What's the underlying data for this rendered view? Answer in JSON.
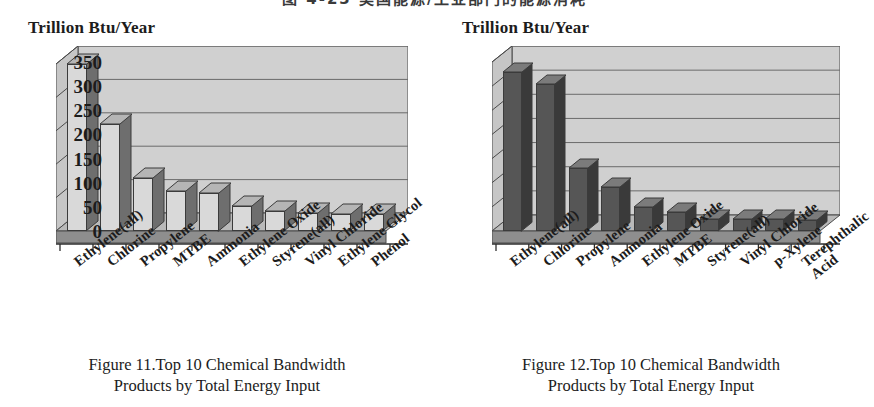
{
  "top_headline_clipped": "图 4-23  美国能源/工业部门的能源消耗",
  "figures": [
    {
      "id": "figure-11",
      "y_axis_title": "Trillion Btu/Year",
      "caption_line1": "Figure 11.Top 10 Chemical Bandwidth",
      "caption_line2": "Products by Total Energy Input",
      "bar_fill": "#d9d9d9",
      "bar_side": "#6e6e6e",
      "bar_top": "#b5b5b5"
    },
    {
      "id": "figure-12",
      "y_axis_title": "Trillion Btu/Year",
      "caption_line1": "Figure 12.Top 10 Chemical Bandwidth",
      "caption_line2": "Products by Total Energy Input",
      "bar_fill": "#565656",
      "bar_side": "#3a3a3a",
      "bar_top": "#7b7b7b"
    }
  ],
  "chart_data": [
    {
      "type": "bar",
      "id": "figure-11",
      "title": "Figure 11.Top 10 Chemical Bandwidth Products by Total Energy Input",
      "xlabel": "",
      "ylabel": "Trillion Btu/Year",
      "ylim": [
        0,
        500
      ],
      "yticks": [
        0,
        100,
        200,
        300,
        400,
        500
      ],
      "grid": true,
      "legend": "none",
      "categories": [
        "Ethylene(all)",
        "Chlorine",
        "Propylene",
        "MTBE",
        "Ammonia",
        "Ethylene Oxide",
        "Styrene(all)",
        "Vinyl Chloride",
        "Ethylene Glycol",
        "Phenol"
      ],
      "values": [
        500,
        320,
        160,
        120,
        115,
        75,
        60,
        55,
        50,
        50
      ]
    },
    {
      "type": "bar",
      "id": "figure-12",
      "title": "Figure 12.Top 10 Chemical Bandwidth Products by Total Energy Input",
      "xlabel": "",
      "ylabel": "Trillion Btu/Year",
      "ylim": [
        0,
        350
      ],
      "yticks": [
        0,
        50,
        100,
        150,
        200,
        250,
        300,
        350
      ],
      "grid": true,
      "legend": "none",
      "categories": [
        "Ethylene(all)",
        "Chlorine",
        "Propylene",
        "Ammonia",
        "Ethylene Oxide",
        "MTBE",
        "Styrene(all)",
        "Vinyl Chloride",
        "p-Xylene",
        "Terephthalic Acid"
      ],
      "values": [
        330,
        305,
        130,
        92,
        50,
        40,
        25,
        25,
        25,
        22
      ]
    }
  ]
}
